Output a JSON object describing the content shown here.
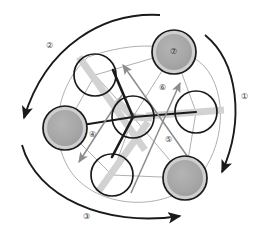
{
  "figure": {
    "type": "diagram",
    "kind": "hexagonal-node-network-with-rotation-arcs",
    "canvas": {
      "width": 261,
      "height": 236,
      "background": "#ffffff"
    },
    "colors": {
      "stroke_dark": "#1a1a1a",
      "node_fill_shaded": "#a8a8a8",
      "node_ring_shaded": "#cfcfcf",
      "node_fill_plain": "#ffffff",
      "bar_gray": "#d0d0d0",
      "thin_link": "#9a9a9a",
      "arrow_gray": "#8c8c8c",
      "label_text": "#3b3b3b"
    }
  },
  "labels": [
    {
      "id": "label-1",
      "text": "①",
      "x": 241,
      "y": 93
    },
    {
      "id": "label-2",
      "text": "②",
      "x": 46,
      "y": 42
    },
    {
      "id": "label-3",
      "text": "③",
      "x": 83,
      "y": 213
    },
    {
      "id": "label-4",
      "text": "④",
      "x": 89,
      "y": 131
    },
    {
      "id": "label-5",
      "text": "⑤",
      "x": 165,
      "y": 136
    },
    {
      "id": "label-6",
      "text": "⑥",
      "x": 159,
      "y": 84
    }
  ],
  "nodes": [
    {
      "id": "node-top-left",
      "label": "",
      "cx": 95,
      "cy": 75,
      "r": 21,
      "shaded": false,
      "bar": "diag-down"
    },
    {
      "id": "node-top-right",
      "label": "⑦",
      "cx": 174,
      "cy": 52,
      "r": 22,
      "shaded": true,
      "bar": "none"
    },
    {
      "id": "node-left",
      "label": "",
      "cx": 65,
      "cy": 128,
      "r": 22,
      "shaded": true,
      "bar": "none"
    },
    {
      "id": "node-right",
      "label": "",
      "cx": 196,
      "cy": 112,
      "r": 21,
      "shaded": false,
      "bar": "horizontal"
    },
    {
      "id": "node-bottom-left",
      "label": "",
      "cx": 112,
      "cy": 175,
      "r": 21,
      "shaded": false,
      "bar": "diag-down"
    },
    {
      "id": "node-bottom-right",
      "label": "",
      "cx": 185,
      "cy": 178,
      "r": 22,
      "shaded": true,
      "bar": "none"
    },
    {
      "id": "node-center",
      "label": "⑧",
      "cx": 133,
      "cy": 117,
      "r": 21,
      "shaded": false,
      "bar": "tri-spoke"
    }
  ],
  "arcs": [
    {
      "id": "arc-1",
      "label_ref": "label-1",
      "description": "outer right arc, arrowhead at lower right"
    },
    {
      "id": "arc-2",
      "label_ref": "label-2",
      "description": "outer upper-left arc, arrowhead at lower left"
    },
    {
      "id": "arc-3",
      "label_ref": "label-3",
      "description": "outer bottom arc, arrowhead at right"
    }
  ],
  "inner_arrows": [
    {
      "id": "inner-arrow-6",
      "label_ref": "label-6",
      "direction": "up-left",
      "description": "gray arrow from lower right toward upper left"
    },
    {
      "id": "inner-arrow-5",
      "label_ref": "label-5",
      "direction": "up-right",
      "description": "gray arrow from lower left toward upper right"
    },
    {
      "id": "inner-arrow-4",
      "label_ref": "label-4",
      "direction": "down-left",
      "description": "gray arrow from center toward lower left"
    }
  ]
}
